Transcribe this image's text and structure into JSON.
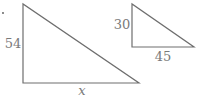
{
  "figure": {
    "large_triangle": {
      "leg_vertical_label": "54",
      "leg_horizontal_label": "x"
    },
    "small_triangle": {
      "leg_vertical_label": "30",
      "leg_horizontal_label": "45"
    },
    "colors": {
      "stroke": "#6e6e6e",
      "text": "#7a7a7a",
      "background": "#ffffff"
    }
  }
}
